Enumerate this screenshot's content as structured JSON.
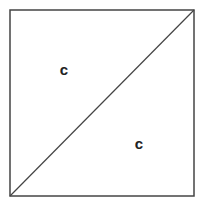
{
  "diagram": {
    "shape": "square-with-diagonal",
    "square": {
      "x": 10,
      "y": 10,
      "width": 184,
      "height": 186,
      "stroke": "#444444"
    },
    "diagonal": {
      "from": "bottom-left",
      "to": "top-right",
      "stroke": "#444444"
    },
    "labels": [
      {
        "text": "c",
        "region": "upper-left-triangle",
        "x": 64,
        "y": 75
      },
      {
        "text": "c",
        "region": "lower-right-triangle",
        "x": 139,
        "y": 149
      }
    ]
  }
}
